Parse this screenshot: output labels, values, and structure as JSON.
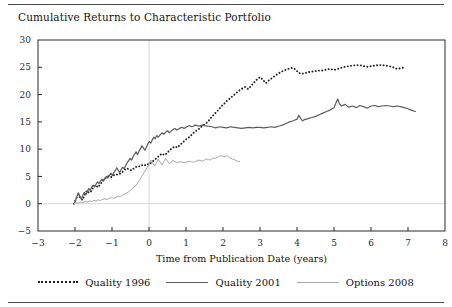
{
  "figure": {
    "title": "Cumulative Returns to Characteristic Portfolio",
    "rule_color": "#4a4a4a"
  },
  "legend": {
    "position": "bottom-center",
    "entries": [
      {
        "label": "Quality 1996",
        "style": "dotted",
        "color": "#1e1e1e",
        "swatch_name": "legend-swatch-dotted"
      },
      {
        "label": "Quality 2001",
        "style": "solid",
        "color": "#5c5c5c",
        "swatch_name": "legend-swatch-solid-dark"
      },
      {
        "label": "Options 2008",
        "style": "solid",
        "color": "#a8a8a8",
        "swatch_name": "legend-swatch-solid-light"
      }
    ]
  },
  "axes": {
    "xlabel": "Time from Publication Date (years)",
    "ylabel": "",
    "xticks": [
      "-3",
      "-2",
      "-1",
      "0",
      "1",
      "2",
      "3",
      "4",
      "5",
      "6",
      "7",
      "8"
    ],
    "yticks": [
      "-5",
      "0",
      "5",
      "10",
      "15",
      "20",
      "25",
      "30"
    ]
  },
  "chart_data": {
    "type": "line",
    "title": "Cumulative Returns to Characteristic Portfolio",
    "xlabel": "Time from Publication Date (years)",
    "ylabel": "",
    "xlim": [
      -3,
      8
    ],
    "ylim": [
      -5,
      30
    ],
    "xtick_values": [
      -3,
      -2,
      -1,
      0,
      1,
      2,
      3,
      4,
      5,
      6,
      7,
      8
    ],
    "ytick_values": [
      -5,
      0,
      5,
      10,
      15,
      20,
      25,
      30
    ],
    "grid": false,
    "reference_lines": [
      {
        "axis": "y",
        "value": 0,
        "color": "#d8d8d8"
      },
      {
        "axis": "x",
        "value": 0,
        "color": "#d8d8d8"
      }
    ],
    "legend_position": "below-axes",
    "series": [
      {
        "name": "Quality 1996",
        "style": "dotted",
        "color": "#1e1e1e",
        "x": [
          -2.03,
          -1.97,
          -1.92,
          -1.86,
          -1.8,
          -1.74,
          -1.68,
          -1.62,
          -1.56,
          -1.5,
          -1.44,
          -1.38,
          -1.32,
          -1.26,
          -1.2,
          -1.14,
          -1.08,
          -1.02,
          -0.96,
          -0.9,
          -0.84,
          -0.78,
          -0.72,
          -0.66,
          -0.6,
          -0.54,
          -0.48,
          -0.42,
          -0.36,
          -0.3,
          -0.24,
          -0.18,
          -0.12,
          -0.06,
          0.0,
          0.07,
          0.14,
          0.21,
          0.28,
          0.35,
          0.42,
          0.49,
          0.56,
          0.63,
          0.7,
          0.77,
          0.84,
          0.91,
          0.98,
          1.05,
          1.12,
          1.19,
          1.26,
          1.33,
          1.4,
          1.47,
          1.54,
          1.61,
          1.68,
          1.75,
          1.82,
          1.89,
          1.96,
          2.03,
          2.1,
          2.17,
          2.24,
          2.31,
          2.38,
          2.45,
          2.52,
          2.6,
          2.68,
          2.76,
          2.84,
          2.92,
          3.0,
          3.08,
          3.16,
          3.24,
          3.32,
          3.4,
          3.48,
          3.56,
          3.64,
          3.72,
          3.8,
          3.88,
          3.96,
          4.04,
          4.12,
          4.2,
          4.3,
          4.4,
          4.5,
          4.6,
          4.7,
          4.8,
          4.9,
          5.0,
          5.1,
          5.2,
          5.3,
          5.4,
          5.5,
          5.6,
          5.7,
          5.8,
          5.9,
          6.0,
          6.1,
          6.2,
          6.3,
          6.4,
          6.5,
          6.6,
          6.7,
          6.8,
          6.9
        ],
        "y": [
          0.0,
          0.9,
          1.7,
          1.1,
          0.7,
          1.6,
          2.4,
          2.0,
          2.3,
          3.1,
          3.4,
          3.0,
          3.5,
          4.1,
          4.6,
          4.9,
          5.1,
          4.9,
          5.2,
          5.4,
          5.3,
          5.5,
          5.8,
          6.2,
          6.5,
          6.3,
          6.1,
          6.4,
          6.7,
          6.9,
          6.8,
          7.1,
          7.0,
          7.3,
          7.2,
          7.6,
          8.0,
          8.4,
          8.8,
          9.2,
          8.9,
          9.3,
          9.8,
          10.2,
          10.5,
          10.3,
          10.8,
          11.2,
          11.7,
          12.0,
          12.4,
          12.9,
          13.3,
          13.6,
          14.0,
          14.4,
          14.7,
          15.2,
          15.8,
          16.3,
          16.8,
          17.3,
          17.9,
          18.3,
          18.8,
          19.2,
          19.6,
          20.0,
          20.4,
          20.8,
          21.1,
          21.4,
          21.0,
          21.6,
          22.2,
          22.8,
          23.2,
          22.7,
          22.1,
          22.6,
          23.0,
          23.4,
          23.8,
          24.1,
          24.4,
          24.6,
          24.8,
          24.9,
          24.6,
          24.0,
          23.8,
          23.9,
          24.1,
          24.2,
          24.3,
          24.4,
          24.4,
          24.6,
          24.7,
          24.5,
          24.7,
          24.9,
          25.1,
          25.2,
          25.3,
          25.4,
          25.4,
          25.2,
          25.1,
          25.2,
          25.3,
          25.4,
          25.4,
          25.3,
          25.2,
          25.0,
          24.7,
          24.8,
          25.0
        ]
      },
      {
        "name": "Quality 2001",
        "style": "solid",
        "color": "#5c5c5c",
        "x": [
          -2.03,
          -1.99,
          -1.95,
          -1.91,
          -1.87,
          -1.83,
          -1.79,
          -1.75,
          -1.71,
          -1.67,
          -1.63,
          -1.59,
          -1.55,
          -1.51,
          -1.47,
          -1.43,
          -1.39,
          -1.35,
          -1.31,
          -1.27,
          -1.23,
          -1.19,
          -1.15,
          -1.11,
          -1.07,
          -1.03,
          -0.99,
          -0.95,
          -0.91,
          -0.87,
          -0.83,
          -0.79,
          -0.75,
          -0.71,
          -0.67,
          -0.63,
          -0.59,
          -0.55,
          -0.51,
          -0.47,
          -0.43,
          -0.39,
          -0.35,
          -0.31,
          -0.27,
          -0.23,
          -0.19,
          -0.15,
          -0.11,
          -0.07,
          -0.03,
          0.01,
          0.05,
          0.09,
          0.13,
          0.17,
          0.21,
          0.25,
          0.3,
          0.35,
          0.4,
          0.45,
          0.5,
          0.55,
          0.6,
          0.65,
          0.7,
          0.75,
          0.8,
          0.85,
          0.9,
          0.95,
          1.0,
          1.05,
          1.1,
          1.15,
          1.2,
          1.25,
          1.3,
          1.35,
          1.4,
          1.45,
          1.5,
          1.6,
          1.7,
          1.8,
          1.9,
          2.0,
          2.1,
          2.2,
          2.3,
          2.4,
          2.5,
          2.6,
          2.7,
          2.8,
          2.9,
          3.0,
          3.1,
          3.2,
          3.3,
          3.4,
          3.5,
          3.6,
          3.7,
          3.8,
          3.9,
          4.0,
          4.05,
          4.1,
          4.15,
          4.2,
          4.3,
          4.4,
          4.5,
          4.6,
          4.7,
          4.8,
          4.9,
          5.0,
          5.05,
          5.1,
          5.15,
          5.2,
          5.3,
          5.4,
          5.5,
          5.6,
          5.7,
          5.8,
          5.9,
          6.0,
          6.1,
          6.2,
          6.3,
          6.4,
          6.5,
          6.6,
          6.7,
          6.8,
          6.9,
          7.0,
          7.1,
          7.2
        ],
        "y": [
          0.0,
          0.5,
          1.3,
          2.0,
          1.4,
          0.8,
          1.5,
          2.1,
          1.6,
          2.2,
          2.8,
          2.4,
          3.0,
          3.4,
          3.1,
          3.6,
          4.0,
          3.7,
          4.2,
          4.5,
          4.2,
          4.6,
          5.0,
          4.7,
          5.2,
          5.6,
          5.2,
          5.7,
          6.1,
          6.6,
          6.1,
          5.7,
          6.3,
          6.7,
          6.4,
          7.0,
          7.5,
          7.9,
          8.3,
          8.0,
          8.6,
          9.1,
          9.5,
          9.0,
          9.6,
          10.1,
          10.6,
          10.2,
          9.8,
          10.4,
          11.0,
          11.4,
          11.1,
          11.7,
          12.2,
          11.9,
          12.5,
          12.2,
          12.6,
          13.0,
          12.7,
          13.1,
          13.4,
          13.0,
          13.3,
          13.6,
          13.8,
          13.5,
          13.7,
          13.9,
          14.0,
          13.8,
          14.0,
          14.2,
          14.3,
          14.1,
          14.2,
          14.4,
          14.3,
          14.2,
          14.3,
          14.4,
          14.3,
          14.2,
          14.1,
          13.9,
          14.1,
          14.0,
          13.9,
          14.1,
          14.0,
          13.9,
          13.8,
          13.9,
          14.0,
          13.9,
          14.0,
          14.0,
          13.9,
          14.0,
          14.1,
          14.0,
          14.2,
          14.4,
          14.7,
          15.0,
          15.2,
          15.5,
          16.2,
          15.6,
          15.2,
          15.4,
          15.6,
          15.8,
          16.0,
          16.3,
          16.6,
          16.9,
          17.2,
          17.6,
          18.4,
          19.2,
          18.3,
          17.9,
          18.2,
          17.7,
          17.9,
          17.6,
          18.0,
          17.8,
          17.5,
          17.9,
          18.0,
          17.8,
          17.9,
          18.0,
          17.9,
          17.8,
          17.9,
          17.8,
          17.6,
          17.4,
          17.1,
          16.9
        ]
      },
      {
        "name": "Options 2008",
        "style": "solid",
        "color": "#a8a8a8",
        "x": [
          -2.03,
          -1.97,
          -1.91,
          -1.85,
          -1.79,
          -1.73,
          -1.67,
          -1.61,
          -1.55,
          -1.49,
          -1.43,
          -1.37,
          -1.31,
          -1.25,
          -1.19,
          -1.13,
          -1.07,
          -1.01,
          -0.95,
          -0.89,
          -0.83,
          -0.77,
          -0.71,
          -0.65,
          -0.59,
          -0.53,
          -0.47,
          -0.41,
          -0.35,
          -0.29,
          -0.23,
          -0.17,
          -0.11,
          -0.05,
          0.0,
          0.05,
          0.1,
          0.15,
          0.2,
          0.25,
          0.3,
          0.35,
          0.4,
          0.45,
          0.5,
          0.55,
          0.6,
          0.65,
          0.7,
          0.75,
          0.8,
          0.85,
          0.9,
          0.95,
          1.0,
          1.05,
          1.1,
          1.15,
          1.2,
          1.25,
          1.3,
          1.35,
          1.4,
          1.45,
          1.5,
          1.55,
          1.6,
          1.65,
          1.7,
          1.75,
          1.8,
          1.85,
          1.9,
          1.95,
          2.0,
          2.05,
          2.1,
          2.15,
          2.2,
          2.25,
          2.3,
          2.35,
          2.4,
          2.45
        ],
        "y": [
          0.0,
          0.2,
          0.1,
          0.3,
          0.2,
          0.4,
          0.3,
          0.5,
          0.4,
          0.6,
          0.5,
          0.7,
          0.6,
          0.8,
          0.9,
          0.8,
          1.0,
          1.1,
          1.0,
          1.2,
          1.4,
          1.3,
          1.6,
          1.8,
          2.0,
          2.3,
          2.6,
          3.0,
          3.4,
          4.0,
          4.6,
          5.3,
          6.0,
          6.6,
          7.2,
          8.0,
          7.4,
          6.9,
          7.5,
          8.2,
          7.6,
          7.1,
          7.7,
          8.3,
          7.8,
          7.3,
          7.6,
          7.9,
          7.7,
          7.5,
          7.6,
          7.7,
          7.6,
          7.5,
          7.6,
          7.7,
          7.8,
          7.7,
          7.6,
          7.7,
          7.9,
          8.0,
          7.9,
          7.8,
          8.0,
          8.2,
          8.1,
          8.0,
          8.2,
          8.4,
          8.3,
          8.5,
          8.7,
          8.8,
          8.7,
          8.6,
          8.8,
          8.6,
          8.4,
          8.2,
          8.1,
          7.9,
          7.8,
          7.7
        ]
      }
    ]
  }
}
